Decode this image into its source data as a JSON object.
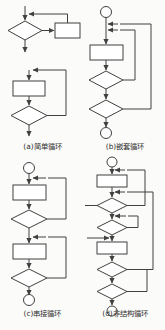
{
  "figure": {
    "background_color": "#fbfbfa",
    "line_color": "#404040",
    "shape_fill": "#ffffff",
    "text_color": "#2e2e2e",
    "width": 165,
    "height": 330,
    "layout": "2x2 grid of flowchart panels with captions beneath each"
  },
  "panels": [
    {
      "id": "a",
      "caption": "(a)简单循环",
      "label": "(a)",
      "name": "简单循环",
      "position": "top-left",
      "description": "两个子图：上方为先判断型循环（while），下方为后判断型循环（repeat-until）",
      "shapes": [
        {
          "type": "arrow-in",
          "name": "entry-arrow-top"
        },
        {
          "type": "decision",
          "name": "while-condition-diamond"
        },
        {
          "type": "process",
          "name": "while-body-box"
        },
        {
          "type": "arrow-out",
          "name": "exit-arrow-top"
        },
        {
          "type": "arrow-in",
          "name": "entry-arrow-bottom"
        },
        {
          "type": "process",
          "name": "until-body-box"
        },
        {
          "type": "decision",
          "name": "until-condition-diamond"
        },
        {
          "type": "arrow-out",
          "name": "exit-arrow-bottom"
        }
      ]
    },
    {
      "id": "b",
      "caption": "(b)嵌套循环",
      "label": "(b)",
      "name": "嵌套循环",
      "position": "top-right",
      "description": "起始圆，处理框，两个判断菱形，两条回边分别回到处理框之前，终止圆",
      "shapes": [
        {
          "type": "terminator",
          "name": "start-circle"
        },
        {
          "type": "process",
          "name": "body-box"
        },
        {
          "type": "decision",
          "name": "inner-condition-diamond"
        },
        {
          "type": "decision",
          "name": "outer-condition-diamond"
        },
        {
          "type": "terminator",
          "name": "end-circle"
        },
        {
          "type": "loop-back",
          "name": "inner-loop-backedge"
        },
        {
          "type": "loop-back",
          "name": "outer-loop-backedge"
        }
      ]
    },
    {
      "id": "c",
      "caption": "(c)串接循环",
      "label": "(c)",
      "name": "串接循环",
      "position": "bottom-left",
      "description": "起始圆，两组串接的处理框与判断菱形循环，终止圆",
      "shapes": [
        {
          "type": "terminator",
          "name": "start-circle"
        },
        {
          "type": "process",
          "name": "first-body-box"
        },
        {
          "type": "decision",
          "name": "first-condition-diamond"
        },
        {
          "type": "process",
          "name": "second-body-box"
        },
        {
          "type": "decision",
          "name": "second-condition-diamond"
        },
        {
          "type": "terminator",
          "name": "end-circle"
        },
        {
          "type": "loop-back",
          "name": "first-loop-backedge"
        },
        {
          "type": "loop-back",
          "name": "second-loop-backedge"
        }
      ]
    },
    {
      "id": "d",
      "caption": "(d)非结构循环",
      "label": "(d)",
      "name": "非结构循环",
      "position": "bottom-right",
      "description": "起始圆，两个处理框，四个判断菱形，多条交叉回边及两个外部入口箭头，终止圆",
      "shapes": [
        {
          "type": "terminator",
          "name": "start-circle"
        },
        {
          "type": "process",
          "name": "first-body-box"
        },
        {
          "type": "decision",
          "name": "first-condition-diamond"
        },
        {
          "type": "decision",
          "name": "second-condition-diamond"
        },
        {
          "type": "process",
          "name": "second-body-box"
        },
        {
          "type": "decision",
          "name": "third-condition-diamond"
        },
        {
          "type": "decision",
          "name": "fourth-condition-diamond"
        },
        {
          "type": "terminator",
          "name": "end-circle"
        },
        {
          "type": "arrow-in",
          "name": "external-entry-arrow-upper"
        },
        {
          "type": "arrow-in",
          "name": "external-entry-arrow-lower"
        },
        {
          "type": "loop-back",
          "name": "crossing-backedge-1"
        },
        {
          "type": "loop-back",
          "name": "crossing-backedge-2"
        },
        {
          "type": "loop-back",
          "name": "crossing-backedge-3"
        }
      ]
    }
  ]
}
